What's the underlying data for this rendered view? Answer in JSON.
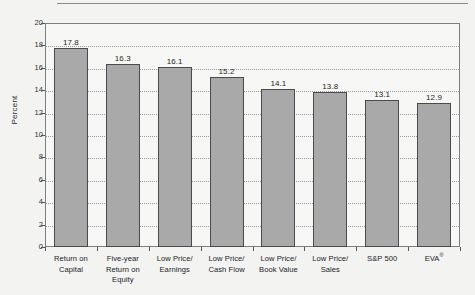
{
  "chart_data": {
    "type": "bar",
    "title": "",
    "subtitle": "",
    "xlabel": "",
    "ylabel": "Percent",
    "ylim": [
      0,
      20
    ],
    "ytick_step": 2,
    "yticks": [
      "0",
      "2",
      "4",
      "6",
      "8",
      "10",
      "12",
      "14",
      "16",
      "18",
      "20"
    ],
    "grid": true,
    "grid_style": "dotted-horizontal",
    "legend": "none",
    "categories": [
      "Return on Capital",
      "Five-year Return on Equity",
      "Low Price/ Earnings",
      "Low Price/ Cash Flow",
      "Low Price/ Book Value",
      "Low Price/ Sales",
      "S&P 500",
      "EVA®"
    ],
    "category_lines": [
      [
        "Return on",
        "Capital"
      ],
      [
        "Five-year",
        "Return on",
        "Equity"
      ],
      [
        "Low Price/",
        "Earnings"
      ],
      [
        "Low Price/",
        "Cash Flow"
      ],
      [
        "Low Price/",
        "Book Value"
      ],
      [
        "Low Price/",
        "Sales"
      ],
      [
        "S&P 500"
      ],
      [
        "EVA®"
      ]
    ],
    "values": [
      17.8,
      16.3,
      16.1,
      15.2,
      14.1,
      13.8,
      13.1,
      12.9
    ],
    "value_labels": [
      "17.8",
      "16.3",
      "16.1",
      "15.2",
      "14.1",
      "13.8",
      "13.1",
      "12.9"
    ],
    "colors": {
      "bar_fill": "#a9a9a9",
      "bar_border": "#4a4a4f",
      "plot_background": "#f7f7f5",
      "figure_background": "#f3f3f1",
      "gridline": "#9a9aa2",
      "axis": "#7d7d84",
      "text": "#222227"
    }
  }
}
